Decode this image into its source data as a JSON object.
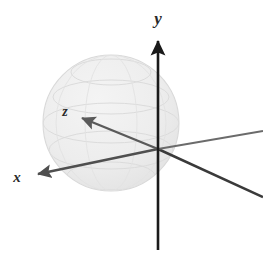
{
  "figure": {
    "canvas": {
      "width": 263,
      "height": 267,
      "background": "#ffffff"
    }
  },
  "sphere": {
    "name": "sphere",
    "center": {
      "x": 111,
      "y": 123
    },
    "radius": 68,
    "fill_color": "#ebebeb",
    "outline_color": "#d8d8d8",
    "gridline_color": "#dcdcdc",
    "latitude_count": 5,
    "longitude_count": 2
  },
  "origin": {
    "x": 158,
    "y": 149
  },
  "axes": [
    {
      "id": "y",
      "label": "y",
      "label_position": {
        "x": 158,
        "y": 23
      },
      "color": "#1a1a1a",
      "stroke_width": 2.6,
      "arrow": true,
      "arrow_tip": {
        "x": 158,
        "y": 36
      },
      "start": {
        "x": 158,
        "y": 250
      },
      "direction": "up"
    },
    {
      "id": "x",
      "label": "x",
      "label_position": {
        "x": 17,
        "y": 181
      },
      "color": "#4f4f4f",
      "stroke_width": 2.4,
      "arrow": true,
      "arrow_tip": {
        "x": 33,
        "y": 176
      },
      "start": {
        "x": 263,
        "y": 197
      },
      "direction": "down-left"
    },
    {
      "id": "z",
      "label": "z",
      "label_position": {
        "x": 65,
        "y": 115
      },
      "color": "#5a5a5a",
      "stroke_width": 2.4,
      "arrow": true,
      "arrow_tip": {
        "x": 78,
        "y": 116
      },
      "start": {
        "x": 263,
        "y": 131
      },
      "direction": "up-left"
    }
  ]
}
